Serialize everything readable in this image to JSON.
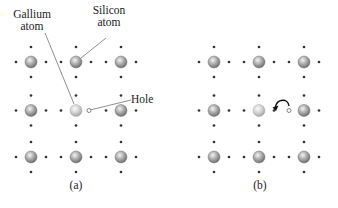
{
  "figure": {
    "panel_a": {
      "caption": "(a)",
      "labels": {
        "gallium_line1": "Gallium",
        "gallium_line2": "atom",
        "silicon_line1": "Silicon",
        "silicon_line2": "atom",
        "hole": "Hole"
      }
    },
    "panel_b": {
      "caption": "(b)"
    },
    "lattice": {
      "rows": 3,
      "cols": 3,
      "dopant_position": "center",
      "description": "Silicon lattice with gallium dopant atom at center; hole adjacent to right of gallium atom"
    },
    "colors": {
      "silicon_atom": "#8a8a8a",
      "gallium_atom": "#bdbdbd",
      "electron_dot": "#333333",
      "leader_line": "#444444"
    }
  }
}
